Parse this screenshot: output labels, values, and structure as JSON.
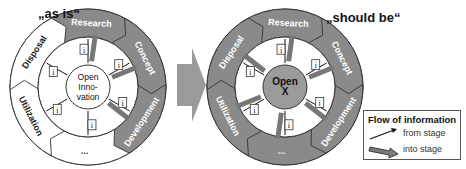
{
  "diagram": {
    "left": {
      "title": "„as is“",
      "center_label": [
        "Open",
        "Inno-",
        "vation"
      ],
      "stages": [
        {
          "label": "Research",
          "fill": "#8a8a8a",
          "text_color": "#ffffff"
        },
        {
          "label": "Concept",
          "fill": "#8a8a8a",
          "text_color": "#ffffff"
        },
        {
          "label": "Development",
          "fill": "#8a8a8a",
          "text_color": "#ffffff"
        },
        {
          "label": "...",
          "fill": "#ffffff",
          "text_color": "#222222"
        },
        {
          "label": "Utilization",
          "fill": "#ffffff",
          "text_color": "#222222"
        },
        {
          "label": "Disposal",
          "fill": "#ffffff",
          "text_color": "#222222"
        }
      ],
      "info_marker": "i"
    },
    "transition_arrow": {
      "fill": "#9a9a9a"
    },
    "right": {
      "title": "„should be“",
      "center_label": [
        "Open",
        "X"
      ],
      "stages": [
        {
          "label": "Research",
          "fill": "#8a8a8a",
          "text_color": "#ffffff"
        },
        {
          "label": "Concept",
          "fill": "#8a8a8a",
          "text_color": "#ffffff"
        },
        {
          "label": "Development",
          "fill": "#8a8a8a",
          "text_color": "#ffffff"
        },
        {
          "label": "...",
          "fill": "#8a8a8a",
          "text_color": "#ffffff"
        },
        {
          "label": "Utilization",
          "fill": "#8a8a8a",
          "text_color": "#ffffff"
        },
        {
          "label": "Disposal",
          "fill": "#8a8a8a",
          "text_color": "#ffffff"
        }
      ],
      "info_marker": "i"
    },
    "legend": {
      "title": "Flow of information",
      "items": [
        {
          "label": "from stage",
          "icon": "thin-arrow-icon"
        },
        {
          "label": "into stage",
          "icon": "thick-arrow-icon"
        }
      ]
    },
    "colors": {
      "stage_gray": "#8a8a8a",
      "center_gray": "#9b9b9b",
      "outline": "#333333"
    }
  }
}
